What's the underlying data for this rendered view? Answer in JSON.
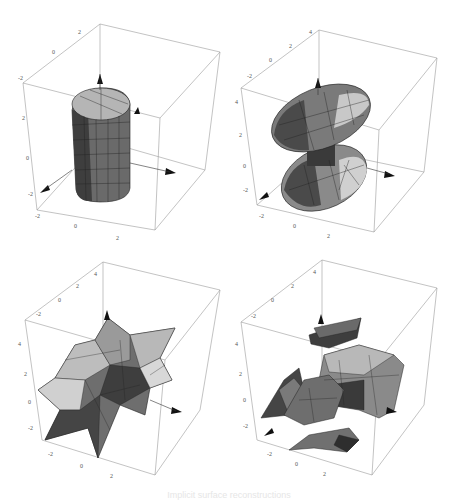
{
  "figure": {
    "caption": "Implicit surface reconstructions",
    "panels": [
      {
        "id": "top-left",
        "shape": "cylinder",
        "x_ticks": [
          "-2",
          "0",
          "2"
        ],
        "y_ticks": [
          "-2",
          "0",
          "2"
        ],
        "z_ticks": [
          "-2",
          "0",
          "2"
        ],
        "axis_labels": [
          "x",
          "y",
          "z"
        ]
      },
      {
        "id": "top-right",
        "shape": "twin-ellipsoid",
        "x_ticks": [
          "-2",
          "0",
          "2",
          "4"
        ],
        "y_ticks": [
          "-2",
          "0",
          "2",
          "4"
        ],
        "z_ticks": [
          "-2",
          "0",
          "2",
          "4"
        ],
        "axis_labels": [
          "x",
          "y",
          "z"
        ]
      },
      {
        "id": "bottom-left",
        "shape": "star-blob",
        "x_ticks": [
          "-2",
          "0",
          "2",
          "4"
        ],
        "y_ticks": [
          "-2",
          "0",
          "2",
          "4"
        ],
        "z_ticks": [
          "-2",
          "0",
          "2",
          "4"
        ],
        "axis_labels": [
          "x",
          "y",
          "z"
        ]
      },
      {
        "id": "bottom-right",
        "shape": "fragments",
        "x_ticks": [
          "-2",
          "0",
          "2",
          "4"
        ],
        "y_ticks": [
          "-2",
          "0",
          "2",
          "4"
        ],
        "z_ticks": [
          "-2",
          "0",
          "2",
          "4"
        ],
        "axis_labels": [
          "x",
          "y",
          "z"
        ]
      }
    ]
  },
  "colors": {
    "box_line": "#9a9a9a",
    "surface_dark": "#3a3a3a",
    "surface_mid": "#7a7a7a",
    "surface_light": "#c8c8c8",
    "mesh_line": "#222222"
  }
}
